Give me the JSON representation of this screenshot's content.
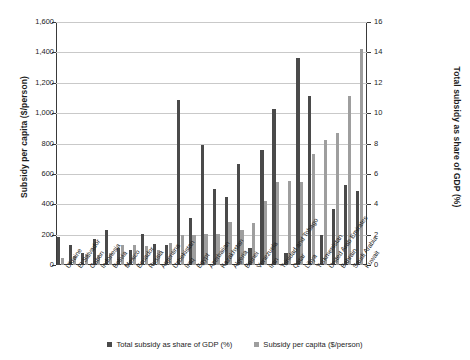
{
  "chart_data": {
    "type": "bar",
    "title": "",
    "subtitle": "",
    "xlabel": "",
    "ylabel": "Subsidy per capita ($/person)",
    "y2label": "Total subsidy as share of GDP (%)",
    "grid": true,
    "legend_position": "bottom",
    "ylim": [
      0,
      1600
    ],
    "y2lim": [
      0,
      16
    ],
    "yticks": [
      "0",
      "200",
      "400",
      "600",
      "800",
      "1,000",
      "1,200",
      "1,400",
      "1,600"
    ],
    "ytick_values": [
      0,
      200,
      400,
      600,
      800,
      1000,
      1200,
      1400,
      1600
    ],
    "y2ticks": [
      "0",
      "2",
      "4",
      "6",
      "8",
      "10",
      "12",
      "14",
      "16"
    ],
    "y2tick_values": [
      0,
      2,
      4,
      6,
      8,
      10,
      12,
      14,
      16
    ],
    "categories": [
      "Ukraine",
      "El Salvador",
      "Gabon",
      "Indonesia",
      "Bolivia",
      "Mexico",
      "Ecuador",
      "Russia",
      "Argentina",
      "Uzbekistan",
      "Iraq",
      "Egypt",
      "Azerbaijan",
      "Kazakhstan",
      "Algeria",
      "Brunei",
      "Venezuela",
      "Iran",
      "Trinidad and Tobago",
      "Qatar",
      "Libya",
      "Turkmenistan",
      "United Arab Emirates",
      "Bahrain",
      "Saudi Arabia",
      "Kuwait"
    ],
    "series": [
      {
        "name": "Total subsidy as share of GDP (%)",
        "axis": "left",
        "color": "#4a4a4a",
        "values": [
          185,
          130,
          78,
          170,
          228,
          112,
          100,
          205,
          138,
          130,
          1088,
          310,
          790,
          500,
          450,
          665,
          110,
          760,
          1030,
          80,
          1360,
          1110,
          200,
          370,
          525,
          485
        ]
      },
      {
        "name": "Subsidy per capita ($/person)",
        "axis": "right",
        "color": "#9e9e9e",
        "values": [
          48,
          58,
          72,
          66,
          78,
          135,
          135,
          125,
          98,
          145,
          195,
          195,
          205,
          205,
          280,
          230,
          275,
          420,
          545,
          555,
          545,
          730,
          825,
          870,
          1115,
          1425
        ]
      }
    ]
  },
  "legend": {
    "items": [
      {
        "label": "Total subsidy as share of GDP (%)",
        "swatch": "dark"
      },
      {
        "label": "Subsidy per capita ($/person)",
        "swatch": "light"
      }
    ]
  }
}
